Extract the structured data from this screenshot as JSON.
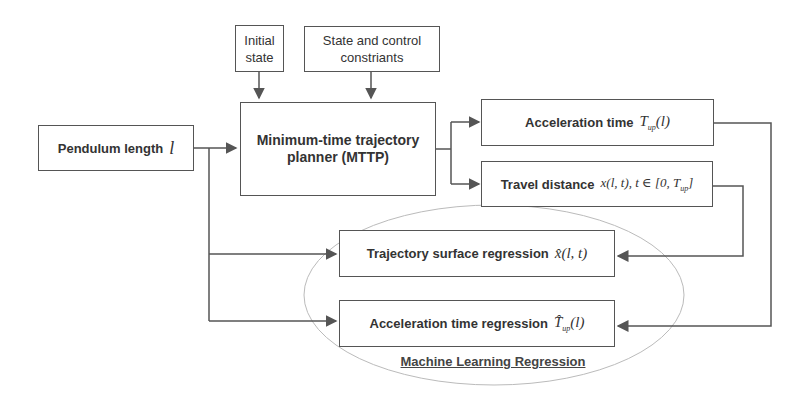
{
  "diagram": {
    "inputs": {
      "initial_state": "Initial state",
      "constraints": "State and control constriants",
      "pendulum_length": "Pendulum length",
      "pendulum_symbol": "l"
    },
    "planner": {
      "label": "Minimum-time trajectory planner (MTTP)"
    },
    "outputs": {
      "acceleration_time": "Acceleration time",
      "acceleration_time_math": "T",
      "acceleration_time_sub": "up",
      "acceleration_time_arg": "(l)",
      "travel_distance": "Travel distance",
      "travel_distance_math": "x(l, t), t ∈ [0, T",
      "travel_distance_sub": "up",
      "travel_distance_close": "]"
    },
    "regression": {
      "trajectory_surface": "Trajectory surface regression",
      "trajectory_surface_math": "x̂(l, t)",
      "acceleration_time": "Acceleration time regression",
      "acceleration_time_math": "T̂",
      "acceleration_time_sub": "up",
      "acceleration_time_arg": "(l)",
      "group_label": "Machine Learning Regression"
    },
    "colors": {
      "line": "#555555",
      "oval": "#bbbbbb"
    }
  }
}
